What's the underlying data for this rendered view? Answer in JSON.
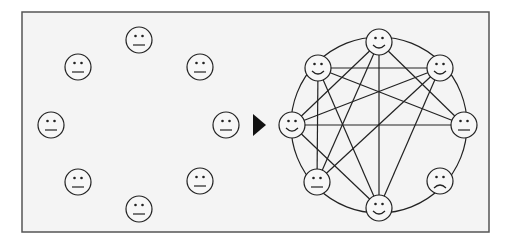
{
  "frame": {
    "x": 22,
    "y": 12,
    "width": 467,
    "height": 220,
    "fill": "#f4f4f4",
    "stroke": "#555555"
  },
  "arrow": {
    "points": [
      [
        253,
        114
      ],
      [
        266,
        125
      ],
      [
        253,
        136
      ]
    ],
    "color": "#111111",
    "icon": "arrow-right-icon"
  },
  "face_radius": 13,
  "face_fill": "#f7f7f7",
  "line_color": "#222222",
  "left_group": {
    "label": "isolated-individuals",
    "faces": [
      {
        "id": "L1",
        "x": 139,
        "y": 40,
        "mood": "neutral"
      },
      {
        "id": "L2",
        "x": 78,
        "y": 67,
        "mood": "neutral"
      },
      {
        "id": "L3",
        "x": 200,
        "y": 67,
        "mood": "neutral"
      },
      {
        "id": "L4",
        "x": 51,
        "y": 125,
        "mood": "neutral"
      },
      {
        "id": "L5",
        "x": 226,
        "y": 125,
        "mood": "neutral"
      },
      {
        "id": "L6",
        "x": 78,
        "y": 182,
        "mood": "neutral"
      },
      {
        "id": "L7",
        "x": 200,
        "y": 181,
        "mood": "neutral"
      },
      {
        "id": "L8",
        "x": 139,
        "y": 209,
        "mood": "neutral"
      }
    ]
  },
  "right_group": {
    "label": "connected-network",
    "ring": {
      "cx": 379,
      "cy": 125,
      "r": 88
    },
    "faces": [
      {
        "id": "R_top",
        "x": 379,
        "y": 42,
        "mood": "smile"
      },
      {
        "id": "R_ul",
        "x": 318,
        "y": 68,
        "mood": "smile"
      },
      {
        "id": "R_ur",
        "x": 440,
        "y": 68,
        "mood": "smile"
      },
      {
        "id": "R_left",
        "x": 292,
        "y": 125,
        "mood": "smile"
      },
      {
        "id": "R_right",
        "x": 464,
        "y": 125,
        "mood": "neutral"
      },
      {
        "id": "R_ll",
        "x": 317,
        "y": 182,
        "mood": "neutral"
      },
      {
        "id": "R_lr",
        "x": 440,
        "y": 181,
        "mood": "frown"
      },
      {
        "id": "R_bottom",
        "x": 379,
        "y": 208,
        "mood": "smile"
      }
    ],
    "edges": [
      [
        "R_top",
        "R_left"
      ],
      [
        "R_top",
        "R_ll"
      ],
      [
        "R_top",
        "R_bottom"
      ],
      [
        "R_top",
        "R_right"
      ],
      [
        "R_ul",
        "R_ur"
      ],
      [
        "R_ul",
        "R_ll"
      ],
      [
        "R_ul",
        "R_bottom"
      ],
      [
        "R_ul",
        "R_right"
      ],
      [
        "R_ur",
        "R_left"
      ],
      [
        "R_ur",
        "R_ll"
      ],
      [
        "R_ur",
        "R_bottom"
      ],
      [
        "R_left",
        "R_right"
      ],
      [
        "R_left",
        "R_bottom"
      ]
    ]
  }
}
